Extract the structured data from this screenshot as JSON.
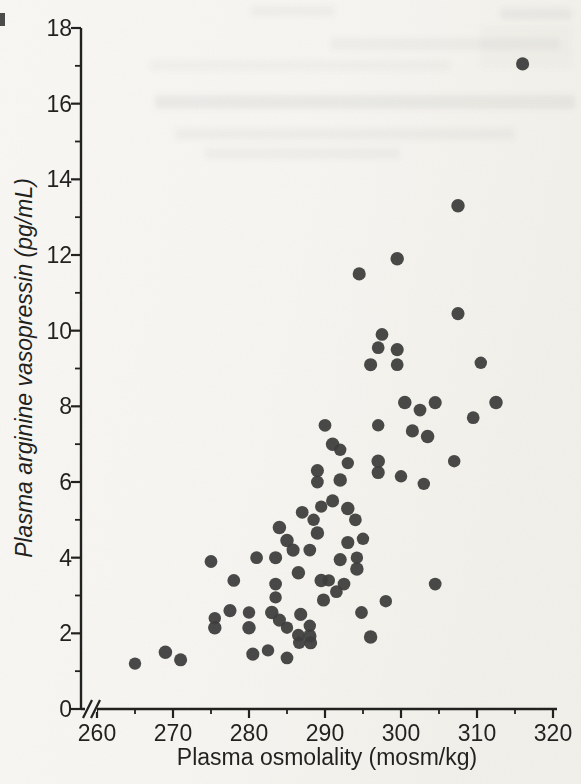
{
  "figure": {
    "kind": "scanned textbook scatter figure",
    "background_color": "#f6f5f1",
    "dot_color": "#3a3a3a",
    "axis_color": "#1d1d1b",
    "text_color": "#1d1d1b"
  },
  "chart_data": {
    "type": "scatter",
    "title": "",
    "xlabel": "Plasma osmolality (mosm/kg)",
    "ylabel": "Plasma arginine vasopressin (pg/mL)",
    "xlim": [
      260,
      320
    ],
    "ylim": [
      0,
      18
    ],
    "x_major_ticks": [
      260,
      270,
      280,
      290,
      300,
      310,
      320
    ],
    "x_minor_ticks": [
      265,
      275,
      285,
      295,
      305,
      315
    ],
    "y_major_ticks": [
      0,
      2,
      4,
      6,
      8,
      10,
      12,
      14,
      16,
      18
    ],
    "y_minor_ticks": [
      1,
      3,
      5,
      7,
      9,
      11,
      13,
      15,
      17
    ],
    "x_axis_break_before_min": true,
    "grid": false,
    "legend": null,
    "marker": "filled-circle",
    "points": [
      [
        265,
        1.2
      ],
      [
        269,
        1.5
      ],
      [
        271,
        1.3
      ],
      [
        275,
        3.9
      ],
      [
        275.5,
        2.4
      ],
      [
        275.5,
        2.15
      ],
      [
        277.5,
        2.6
      ],
      [
        278,
        3.4
      ],
      [
        280,
        2.55
      ],
      [
        280,
        2.15
      ],
      [
        280.5,
        1.45
      ],
      [
        281,
        4
      ],
      [
        282.5,
        1.55
      ],
      [
        283,
        2.55
      ],
      [
        283.5,
        4
      ],
      [
        283.5,
        3.3
      ],
      [
        283.5,
        2.95
      ],
      [
        284,
        4.8
      ],
      [
        284,
        2.35
      ],
      [
        285,
        1.35
      ],
      [
        285,
        2.15
      ],
      [
        285,
        4.45
      ],
      [
        285.8,
        4.2
      ],
      [
        286.5,
        1.95
      ],
      [
        286.6,
        1.75
      ],
      [
        286.5,
        3.6
      ],
      [
        286.8,
        2.5
      ],
      [
        287,
        5.2
      ],
      [
        288,
        2.2
      ],
      [
        288,
        1.93
      ],
      [
        288.1,
        1.75
      ],
      [
        288,
        4.2
      ],
      [
        288.5,
        5
      ],
      [
        289,
        4.65
      ],
      [
        289,
        6.3
      ],
      [
        289,
        6
      ],
      [
        289.5,
        5.35
      ],
      [
        289.5,
        3.4
      ],
      [
        289.8,
        2.88
      ],
      [
        290,
        7.5
      ],
      [
        290.5,
        3.4
      ],
      [
        291,
        7
      ],
      [
        291,
        5.5
      ],
      [
        291.5,
        3.1
      ],
      [
        292,
        6.85
      ],
      [
        292,
        6.05
      ],
      [
        292,
        3.95
      ],
      [
        292.5,
        3.3
      ],
      [
        293,
        6.5
      ],
      [
        293,
        5.3
      ],
      [
        293,
        4.4
      ],
      [
        294,
        5
      ],
      [
        294.2,
        4
      ],
      [
        294.2,
        3.7
      ],
      [
        294.5,
        11.5
      ],
      [
        294.8,
        2.55
      ],
      [
        295,
        4.5
      ],
      [
        296,
        1.9
      ],
      [
        296,
        9.1
      ],
      [
        297,
        9.55
      ],
      [
        297,
        7.5
      ],
      [
        297,
        6.55
      ],
      [
        297,
        6.25
      ],
      [
        297.5,
        9.9
      ],
      [
        298,
        2.85
      ],
      [
        299.5,
        11.9
      ],
      [
        299.5,
        9.5
      ],
      [
        299.5,
        9.1
      ],
      [
        300,
        6.15
      ],
      [
        300.5,
        8.1
      ],
      [
        301.5,
        7.35
      ],
      [
        302.5,
        7.9
      ],
      [
        303,
        5.95
      ],
      [
        303.5,
        7.2
      ],
      [
        304.5,
        8.1
      ],
      [
        304.5,
        3.3
      ],
      [
        307,
        6.55
      ],
      [
        307.5,
        13.3
      ],
      [
        307.5,
        10.45
      ],
      [
        309.5,
        7.7
      ],
      [
        310.5,
        9.15
      ],
      [
        312.5,
        8.1
      ],
      [
        316,
        17.05
      ]
    ]
  }
}
